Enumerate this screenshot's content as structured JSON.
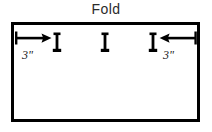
{
  "diagram": {
    "title": "Fold",
    "title_position": "top-center",
    "panel": {
      "name": "fabric-panel",
      "shape": "rectangle",
      "x": 11,
      "y": 22,
      "width": 189,
      "height": 100,
      "stroke": "#000000",
      "stroke_width": 3,
      "fill": "#ffffff"
    },
    "marks": [
      {
        "name": "buttonhole-mark-left",
        "label": "I",
        "x": 57,
        "y": 42
      },
      {
        "name": "buttonhole-mark-center",
        "label": "I",
        "x": 105,
        "y": 42
      },
      {
        "name": "buttonhole-mark-right",
        "label": "I",
        "x": 153,
        "y": 42
      }
    ],
    "dimensions": [
      {
        "name": "dimension-left",
        "label": "3\"",
        "direction": "right",
        "from_x": 15,
        "to_x": 52,
        "y": 38,
        "label_x": 22,
        "label_y": 48
      },
      {
        "name": "dimension-right",
        "label": "3\"",
        "direction": "left",
        "from_x": 196,
        "to_x": 159,
        "y": 38,
        "label_x": 163,
        "label_y": 48
      }
    ],
    "colors": {
      "ink": "#000000",
      "title_ink": "#2b2b2b",
      "background": "#ffffff"
    }
  }
}
